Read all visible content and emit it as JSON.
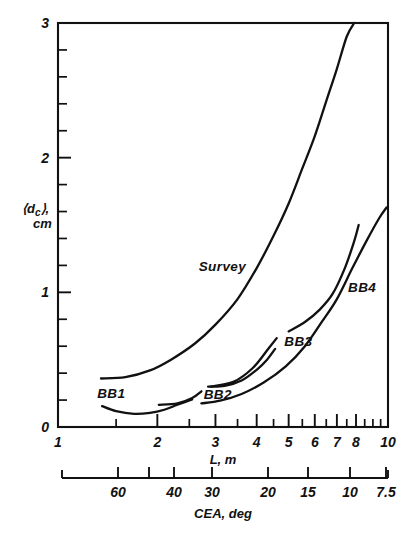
{
  "figure": {
    "background": "#ffffff",
    "ink": "#111111"
  },
  "chart_data": {
    "type": "line",
    "title": "",
    "xlabel": "L, m",
    "ylabel": "⟨d_c⟩, cm",
    "ylabel_line1": "⟨d",
    "ylabel_sub": "c",
    "ylabel_line1_end": "⟩,",
    "ylabel_line2": "cm",
    "x_scale": "log",
    "y_scale": "linear",
    "xlim": [
      1,
      10
    ],
    "ylim": [
      0,
      3
    ],
    "grid": false,
    "legend": "inline-labels",
    "x_ticks_major": [
      1,
      2,
      3,
      4,
      5,
      6,
      7,
      8,
      10
    ],
    "x_tick_labels": [
      "1",
      "2",
      "3",
      "4",
      "5",
      "6",
      "7",
      "8",
      "10"
    ],
    "x_ticks_minor": [
      1.5,
      2.5,
      3.5,
      4.5,
      5.5,
      6.5,
      7.5,
      8.5,
      9,
      9.5
    ],
    "y_ticks_major": [
      0,
      1,
      2,
      3
    ],
    "y_tick_labels": [
      "0",
      "1",
      "2",
      "3"
    ],
    "y_ticks_minor": [
      0.2,
      0.4,
      0.6,
      0.8,
      1.2,
      1.4,
      1.6,
      1.8,
      2.2,
      2.4,
      2.6,
      2.8
    ],
    "secondary_axis": {
      "label": "CEA, deg",
      "ticks": [
        60,
        50,
        40,
        30,
        20,
        15,
        10,
        7.5
      ],
      "tick_labels": [
        "60",
        "",
        "40",
        "30",
        "20",
        "15",
        "10",
        "7.5"
      ],
      "note": "CEA decreases left to right; tick at 50 is unlabeled"
    },
    "series": [
      {
        "name": "Survey",
        "label": "Survey",
        "label_x": 3.15,
        "label_y": 1.16,
        "points": [
          [
            1.35,
            0.36
          ],
          [
            1.6,
            0.37
          ],
          [
            1.9,
            0.42
          ],
          [
            2.2,
            0.5
          ],
          [
            2.6,
            0.62
          ],
          [
            3.0,
            0.76
          ],
          [
            3.5,
            0.95
          ],
          [
            4.0,
            1.18
          ],
          [
            4.5,
            1.42
          ],
          [
            5.0,
            1.66
          ],
          [
            5.5,
            1.92
          ],
          [
            6.0,
            2.16
          ],
          [
            6.5,
            2.42
          ],
          [
            7.0,
            2.66
          ],
          [
            7.5,
            2.9
          ],
          [
            7.9,
            3.0
          ]
        ]
      },
      {
        "name": "BB1",
        "label": "BB1",
        "label_x": 1.45,
        "label_y": 0.215,
        "points": [
          [
            1.36,
            0.155
          ],
          [
            1.5,
            0.118
          ],
          [
            1.7,
            0.098
          ],
          [
            1.9,
            0.105
          ],
          [
            2.1,
            0.128
          ],
          [
            2.3,
            0.165
          ],
          [
            2.55,
            0.205
          ]
        ],
        "branch": {
          "name": "BB1-steep",
          "points": [
            [
              2.02,
              0.165
            ],
            [
              2.3,
              0.175
            ],
            [
              2.55,
              0.215
            ],
            [
              2.72,
              0.265
            ]
          ]
        }
      },
      {
        "name": "BB2",
        "label": "BB2",
        "label_x": 3.05,
        "label_y": 0.205,
        "points": [
          [
            2.85,
            0.3
          ],
          [
            3.2,
            0.305
          ],
          [
            3.6,
            0.345
          ],
          [
            4.0,
            0.425
          ],
          [
            4.3,
            0.5
          ],
          [
            4.55,
            0.58
          ]
        ],
        "branch": {
          "name": "BB2-steep",
          "points": [
            [
              2.9,
              0.3
            ],
            [
              3.4,
              0.335
            ],
            [
              3.9,
              0.44
            ],
            [
              4.35,
              0.585
            ],
            [
              4.6,
              0.66
            ]
          ]
        }
      },
      {
        "name": "BB3",
        "label": "BB3",
        "label_x": 5.35,
        "label_y": 0.6,
        "points": [
          [
            2.72,
            0.175
          ],
          [
            3.1,
            0.195
          ],
          [
            3.6,
            0.245
          ],
          [
            4.2,
            0.33
          ],
          [
            4.9,
            0.45
          ],
          [
            5.6,
            0.6
          ],
          [
            6.3,
            0.78
          ],
          [
            7.0,
            0.95
          ],
          [
            7.8,
            1.18
          ],
          [
            8.6,
            1.38
          ],
          [
            9.4,
            1.55
          ],
          [
            9.9,
            1.63
          ]
        ]
      },
      {
        "name": "BB4",
        "label": "BB4",
        "label_x": 8.35,
        "label_y": 1.0,
        "points": [
          [
            5.0,
            0.71
          ],
          [
            5.6,
            0.78
          ],
          [
            6.2,
            0.87
          ],
          [
            6.8,
            0.99
          ],
          [
            7.4,
            1.18
          ],
          [
            7.9,
            1.38
          ],
          [
            8.15,
            1.5
          ]
        ]
      }
    ]
  }
}
